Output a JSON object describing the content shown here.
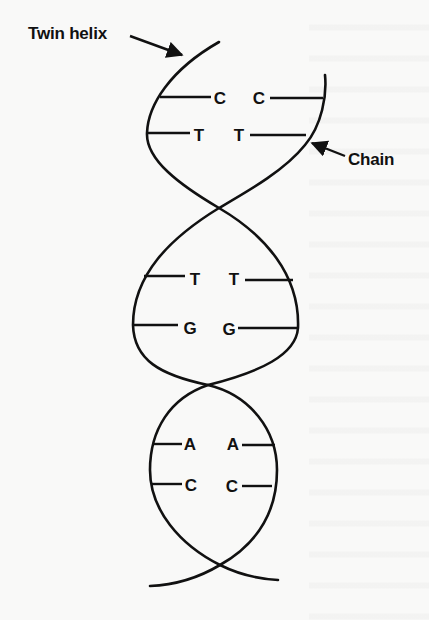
{
  "figure": {
    "labels": {
      "twin_helix": "Twin helix",
      "chain": "Chain"
    },
    "base_pairs": [
      {
        "left": "C",
        "right": "C"
      },
      {
        "left": "T",
        "right": "T"
      },
      {
        "left": "T",
        "right": "T"
      },
      {
        "left": "G",
        "right": "G"
      },
      {
        "left": "A",
        "right": "A"
      },
      {
        "left": "C",
        "right": "C"
      }
    ],
    "colors": {
      "ink": "#111111",
      "paper": "#f9f9f8"
    }
  }
}
